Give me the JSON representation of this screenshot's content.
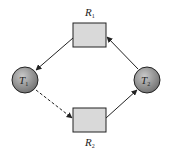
{
  "diagram": {
    "type": "resource-allocation-graph",
    "nodes": [
      {
        "id": "R1",
        "kind": "resource",
        "label": "R",
        "subscript": "1"
      },
      {
        "id": "R2",
        "kind": "resource",
        "label": "R",
        "subscript": "2"
      },
      {
        "id": "T1",
        "kind": "thread",
        "label": "T",
        "subscript": "1"
      },
      {
        "id": "T2",
        "kind": "thread",
        "label": "T",
        "subscript": "2"
      }
    ],
    "edges": [
      {
        "from": "R1",
        "to": "T1",
        "style": "solid",
        "meaning": "assignment"
      },
      {
        "from": "T1",
        "to": "R2",
        "style": "dashed",
        "meaning": "claim"
      },
      {
        "from": "R2",
        "to": "T2",
        "style": "solid",
        "meaning": "assignment"
      },
      {
        "from": "T2",
        "to": "R1",
        "style": "solid",
        "meaning": "request"
      }
    ],
    "colors": {
      "resource_fill": "#d9d9d9",
      "thread_fill": "#8a8a8a",
      "stroke": "#222222"
    }
  }
}
